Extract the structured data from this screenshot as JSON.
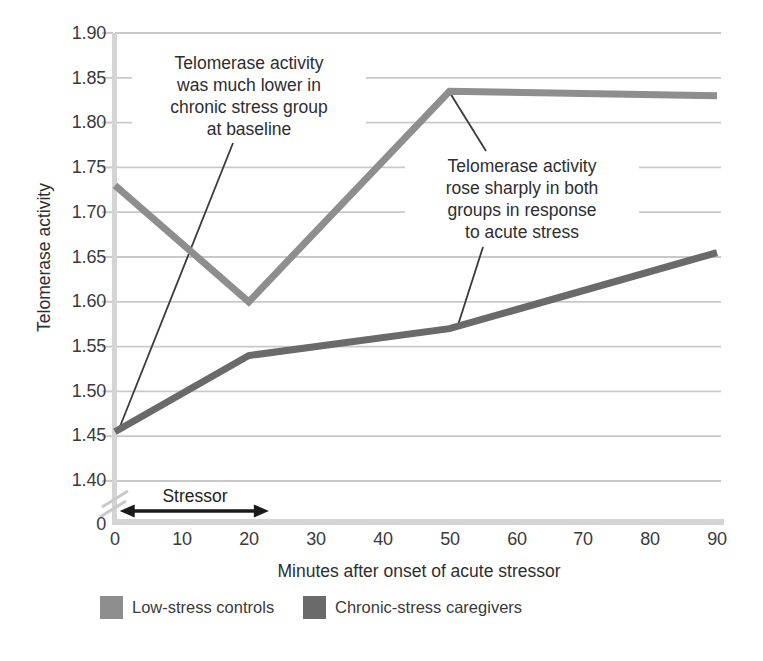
{
  "chart_data": {
    "type": "line",
    "title": "",
    "xlabel": "Minutes after onset of acute stressor",
    "ylabel": "Telomerase activity",
    "x_ticks": [
      "0",
      "10",
      "20",
      "30",
      "40",
      "50",
      "60",
      "70",
      "80",
      "90"
    ],
    "y_ticks": [
      "1.90",
      "1.85",
      "1.80",
      "1.75",
      "1.70",
      "1.65",
      "1.60",
      "1.55",
      "1.50",
      "1.45",
      "1.40"
    ],
    "y_origin_label": "0",
    "xlim": [
      0,
      90
    ],
    "ylim": [
      1.4,
      1.9
    ],
    "grid": "horizontal",
    "axis_break": true,
    "series": [
      {
        "name": "Low-stress controls",
        "color": "#8e8e8e",
        "x": [
          0,
          20,
          50,
          90
        ],
        "values": [
          1.73,
          1.6,
          1.835,
          1.83
        ]
      },
      {
        "name": "Chronic-stress caregivers",
        "color": "#6a6a6a",
        "x": [
          0,
          20,
          50,
          90
        ],
        "values": [
          1.455,
          1.54,
          1.57,
          1.655
        ]
      }
    ],
    "annotations": {
      "baseline_note": "Telomerase activity\nwas much lower in\nchronic stress group\nat baseline",
      "acute_note": "Telomerase activity\nrose sharply in both\ngroups in response\nto acute stress",
      "stressor_label": "Stressor",
      "stressor_span_minutes": [
        0.7,
        23
      ]
    },
    "legend_position": "bottom-left"
  },
  "colors": {
    "background": "#ffffff",
    "gridline": "#c9c9c9",
    "axis": "#d4d4d4",
    "leader_line": "#3a3a3a",
    "arrow": "#1a1a1a",
    "text": "#333333"
  }
}
